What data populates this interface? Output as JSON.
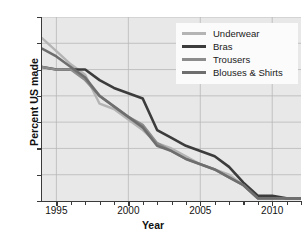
{
  "chart_data": {
    "type": "line",
    "title": "",
    "xlabel": "Year",
    "ylabel": "Percent US made",
    "xlim": [
      1994,
      2012
    ],
    "ylim": [
      0,
      70
    ],
    "xticks": [
      1995,
      2000,
      2005,
      2010
    ],
    "xtick_labels": [
      "1995",
      "2000",
      "2005",
      "2010"
    ],
    "xminor_ticks": [
      1996,
      1997,
      1998,
      1999,
      2001,
      2002,
      2003,
      2004,
      2006,
      2007,
      2008,
      2009,
      2011,
      2012
    ],
    "yticks": [
      0,
      10,
      20,
      30,
      40,
      50,
      60,
      70
    ],
    "ytick_labels": [
      "0",
      "10",
      "20",
      "30",
      "40",
      "50",
      "60",
      "70"
    ],
    "grid": true,
    "grid_axis": "both",
    "legend_position": "top-right",
    "plot_background": "#e8e8e8",
    "series": [
      {
        "name": "Underwear",
        "color": "#b4b4b4",
        "x": [
          1994,
          1995,
          1996,
          1997,
          1998,
          1999,
          2000,
          2001,
          2002,
          2003,
          2004,
          2005,
          2006,
          2007,
          2008,
          2009,
          2010,
          2011,
          2012
        ],
        "values": [
          62,
          57,
          52,
          48,
          37,
          35,
          31,
          27,
          22,
          20,
          17,
          14,
          12,
          10,
          6,
          1,
          1,
          1,
          1
        ]
      },
      {
        "name": "Bras",
        "color": "#3c3c3c",
        "x": [
          1994,
          1995,
          1996,
          1997,
          1998,
          1999,
          2000,
          2001,
          2002,
          2003,
          2004,
          2005,
          2006,
          2007,
          2008,
          2009,
          2010,
          2011,
          2012
        ],
        "values": [
          51,
          50,
          50,
          50,
          46,
          43,
          41,
          39,
          27,
          24,
          21,
          19,
          17,
          13,
          7,
          2,
          2,
          1,
          1
        ]
      },
      {
        "name": "Trousers",
        "color": "#8c8c8c",
        "x": [
          1994,
          1995,
          1996,
          1997,
          1998,
          1999,
          2000,
          2001,
          2002,
          2003,
          2004,
          2005,
          2006,
          2007,
          2008,
          2009,
          2010,
          2011,
          2012
        ],
        "values": [
          51,
          50,
          50,
          46,
          40,
          36,
          32,
          29,
          22,
          19,
          16,
          14,
          12,
          9,
          6,
          1,
          1,
          1,
          1
        ]
      },
      {
        "name": "Blouses & Shirts",
        "color": "#6e6e6e",
        "x": [
          1994,
          1995,
          1996,
          1997,
          1998,
          1999,
          2000,
          2001,
          2002,
          2003,
          2004,
          2005,
          2006,
          2007,
          2008,
          2009,
          2010,
          2011,
          2012
        ],
        "values": [
          58,
          55,
          51,
          47,
          40,
          36,
          32,
          28,
          21,
          19,
          16,
          14,
          12,
          9,
          6,
          1,
          1,
          1,
          1
        ]
      }
    ]
  },
  "legend": {
    "items": [
      {
        "label": "Underwear",
        "color": "#b4b4b4"
      },
      {
        "label": "Bras",
        "color": "#3c3c3c"
      },
      {
        "label": "Trousers",
        "color": "#8c8c8c"
      },
      {
        "label": "Blouses & Shirts",
        "color": "#6e6e6e"
      }
    ]
  }
}
